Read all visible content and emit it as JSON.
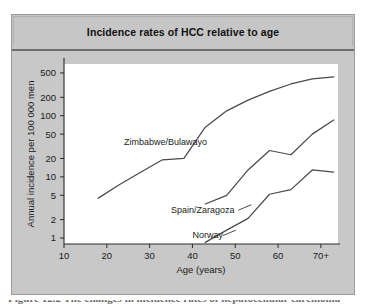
{
  "figure": {
    "title": "Incidence rates of HCC relative to age",
    "caption_partial": "Figure 12.2 The changes in incidence rates of hepatocellular carcinoma"
  },
  "chart_data": {
    "type": "line",
    "title": "Incidence rates of HCC relative to age",
    "xlabel": "Age (years)",
    "ylabel": "Annual incidence per 100 000 men",
    "yscale": "log",
    "grid": false,
    "legend": "inline-labels",
    "xlim": [
      10,
      74
    ],
    "ylim": [
      0.8,
      700
    ],
    "xticks": [
      "10",
      "20",
      "30",
      "40",
      "50",
      "60",
      "70+"
    ],
    "xtick_values": [
      10,
      20,
      30,
      40,
      50,
      60,
      70
    ],
    "yticks": [
      "500",
      "200",
      "100",
      "50",
      "20",
      "10",
      "5",
      "2",
      "1"
    ],
    "ytick_values": [
      500,
      200,
      100,
      50,
      20,
      10,
      5,
      2,
      1
    ],
    "series": [
      {
        "name": "Zimbabwe/Bulawayo",
        "color": "#4a4a4a",
        "x": [
          18,
          23,
          28,
          33,
          38,
          43,
          48,
          53,
          58,
          63,
          68,
          73
        ],
        "values": [
          4.5,
          7.5,
          12,
          19,
          20,
          65,
          120,
          180,
          250,
          330,
          400,
          430
        ]
      },
      {
        "name": "Spain/Zaragoza",
        "color": "#4a4a4a",
        "x": [
          43,
          48,
          53,
          58,
          63,
          68,
          73
        ],
        "values": [
          3.6,
          5.0,
          13,
          27,
          23,
          50,
          85
        ]
      },
      {
        "name": "Norway",
        "color": "#4a4a4a",
        "x": [
          43,
          48,
          53,
          58,
          63,
          68,
          73
        ],
        "values": [
          0.85,
          1.35,
          2.1,
          5.2,
          6.2,
          13,
          12
        ]
      }
    ],
    "annotations": [
      {
        "text": "Zimbabwe/Bulawayo",
        "x": 24,
        "y": 33
      },
      {
        "text": "Spain/Zaragoza",
        "x": 35,
        "y": 2.6
      },
      {
        "text": "Norway",
        "x": 40,
        "y": 1.0
      }
    ]
  },
  "colors": {
    "panel_background": "#c8c8c8",
    "panel_border": "#9a9a9a",
    "title_rule": "#6f6f6f",
    "plot_background": "#ffffff",
    "axis": "#2b2b2b",
    "line": "#4a4a4a",
    "text": "#1a1a1a"
  }
}
